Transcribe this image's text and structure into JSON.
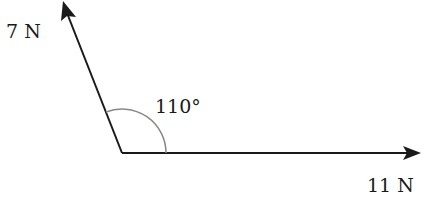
{
  "diagram": {
    "type": "force-vectors",
    "forces": [
      {
        "id": "f1",
        "label": "7 N",
        "magnitude_N": 7,
        "direction_deg": 110
      },
      {
        "id": "f2",
        "label": "11 N",
        "magnitude_N": 11,
        "direction_deg": 0
      }
    ],
    "angle": {
      "label": "110°",
      "value_deg": 110
    }
  },
  "colors": {
    "line": "#1a1a1a",
    "arc": "#888888"
  }
}
